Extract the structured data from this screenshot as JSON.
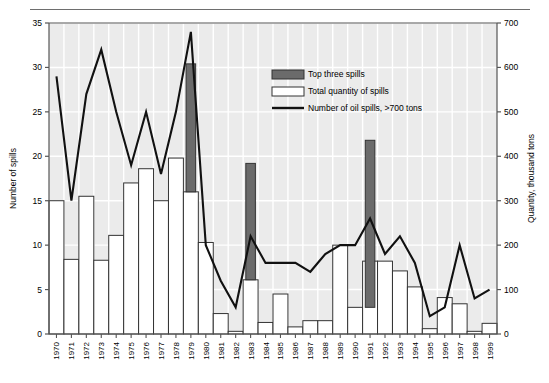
{
  "figure": {
    "name": "oil-spills-chart",
    "top_rule": true,
    "background": "#ffffff",
    "plot_background": "#ebebeb",
    "gridline_color": "#ffffff",
    "axis_color": "#555555",
    "bar_fill_total": "#ffffff",
    "bar_fill_top3": "#6b6b6b",
    "bar_stroke": "#333333",
    "line_color": "#111111"
  },
  "legend": {
    "position": "top-right-inside",
    "items": [
      {
        "label": "Top three spills",
        "type": "swatch",
        "fill": "#6b6b6b",
        "stroke": "#333333"
      },
      {
        "label": "Total quantity of spills",
        "type": "swatch",
        "fill": "#ffffff",
        "stroke": "#333333"
      },
      {
        "label": "Number of oil spills, >700 tons",
        "type": "line",
        "stroke": "#111111"
      }
    ]
  },
  "chart_data": {
    "type": "bar",
    "title": "",
    "subtitle": "",
    "xlabel": "",
    "ylabel": "Number of spills",
    "y2label": "Quantity, thousand tons",
    "grid": true,
    "legend_position": "top-right",
    "ylim": [
      0,
      35
    ],
    "yticks": [
      0,
      5,
      10,
      15,
      20,
      25,
      30,
      35
    ],
    "y2lim": [
      0,
      700
    ],
    "y2ticks": [
      0,
      100,
      200,
      300,
      400,
      500,
      600,
      700
    ],
    "categories": [
      "1970",
      "1971",
      "1972",
      "1973",
      "1974",
      "1975",
      "1976",
      "1977",
      "1978",
      "1979",
      "1980",
      "1981",
      "1982",
      "1983",
      "1984",
      "1985",
      "1986",
      "1987",
      "1988",
      "1989",
      "1990",
      "1991",
      "1992",
      "1993",
      "1994",
      "1995",
      "1996",
      "1997",
      "1998",
      "1999"
    ],
    "series": [
      {
        "name": "Total quantity of spills",
        "axis": "right",
        "unit": "thousand tons",
        "render": "bar",
        "values": [
          300,
          8.4,
          15.5,
          8.3,
          11.1,
          17.0,
          18.6,
          15.0,
          19.8,
          16.0,
          10.3,
          2.3,
          0.3,
          6.1,
          1.3,
          4.5,
          0.8,
          1.5,
          1.5,
          10.0,
          3.0,
          8.2,
          8.2,
          7.1,
          5.3,
          0.6,
          4.1,
          3.4,
          0.3,
          1.2
        ],
        "values_in_left_axis_units": [
          15.0,
          8.4,
          15.5,
          8.3,
          11.1,
          17.0,
          18.6,
          15.0,
          19.8,
          16.0,
          10.3,
          2.3,
          0.3,
          6.1,
          1.3,
          4.5,
          0.8,
          1.5,
          1.5,
          10.0,
          3.0,
          8.2,
          8.2,
          7.1,
          5.3,
          0.6,
          4.1,
          3.4,
          0.3,
          1.2
        ]
      },
      {
        "name": "Top three spills",
        "axis": "right",
        "render": "bar-stacked-top",
        "note": "Dark segment drawn on top of the white total bar; value is the bar top in left-axis units",
        "tops_in_left_axis_units": [
          null,
          null,
          null,
          null,
          null,
          null,
          null,
          null,
          null,
          30.4,
          null,
          null,
          null,
          19.2,
          null,
          null,
          null,
          null,
          null,
          null,
          null,
          21.8,
          null,
          null,
          null,
          null,
          null,
          null,
          null,
          null
        ],
        "years": [
          "1979",
          "1983",
          "1991"
        ],
        "segment_from_to_left_axis_units": [
          {
            "year": "1979",
            "from": 16.0,
            "to": 30.4
          },
          {
            "year": "1983",
            "from": 6.1,
            "to": 19.2
          },
          {
            "year": "1991",
            "from": 3.0,
            "to": 21.8
          }
        ]
      },
      {
        "name": "Number of oil spills, >700 tons",
        "axis": "left",
        "unit": "spills",
        "render": "line",
        "values": [
          29,
          15,
          27,
          32,
          25,
          19,
          25,
          18,
          25,
          34,
          10,
          6,
          3,
          11,
          8,
          8,
          8,
          7,
          9,
          10,
          10,
          13,
          9,
          11,
          8,
          2,
          3,
          10,
          4,
          5
        ]
      }
    ]
  }
}
